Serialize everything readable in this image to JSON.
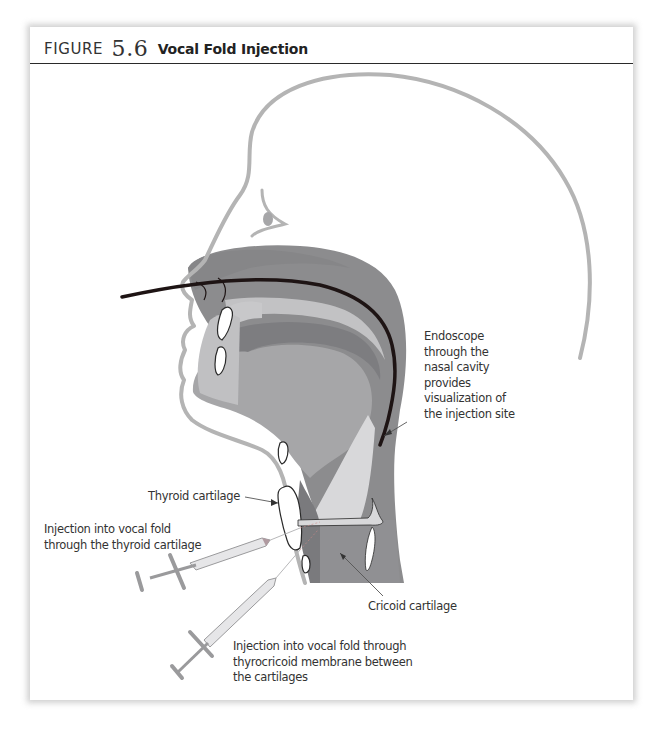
{
  "figure": {
    "label_prefix": "FIGURE",
    "number": "5.6",
    "title": "Vocal Fold Injection"
  },
  "colors": {
    "outline_gray": "#b4b4b4",
    "dark_tissue": "#8a8a8c",
    "mid_tissue": "#a4a4a6",
    "light_tissue": "#c4c4c6",
    "endoscope": "#1e1414",
    "text": "#333333"
  },
  "annotations": {
    "endoscope": {
      "lines": [
        "Endoscope",
        "through the",
        "nasal cavity",
        "provides",
        "visualization of",
        "the injection site"
      ]
    },
    "thyroid_cartilage": {
      "lines": [
        "Thyroid cartilage"
      ]
    },
    "injection_thyroid": {
      "lines": [
        "Injection into vocal fold",
        "through the thyroid cartilage"
      ]
    },
    "cricoid_cartilage": {
      "lines": [
        "Cricoid cartilage"
      ]
    },
    "injection_membrane": {
      "lines": [
        "Injection into vocal fold through",
        "thyrocricoid membrane between",
        "the cartilages"
      ]
    }
  }
}
